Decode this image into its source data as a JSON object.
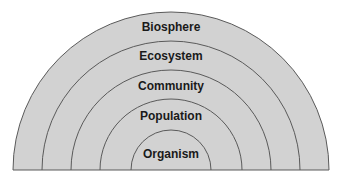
{
  "diagram": {
    "type": "nested-semicircles",
    "fill_color": "#cfcfcf",
    "stroke_color": "#555555",
    "levels": [
      {
        "label": "Biosphere",
        "radius": 158
      },
      {
        "label": "Ecosystem",
        "radius": 129
      },
      {
        "label": "Community",
        "radius": 100
      },
      {
        "label": "Population",
        "radius": 71
      },
      {
        "label": "Organism",
        "radius": 40
      }
    ]
  }
}
